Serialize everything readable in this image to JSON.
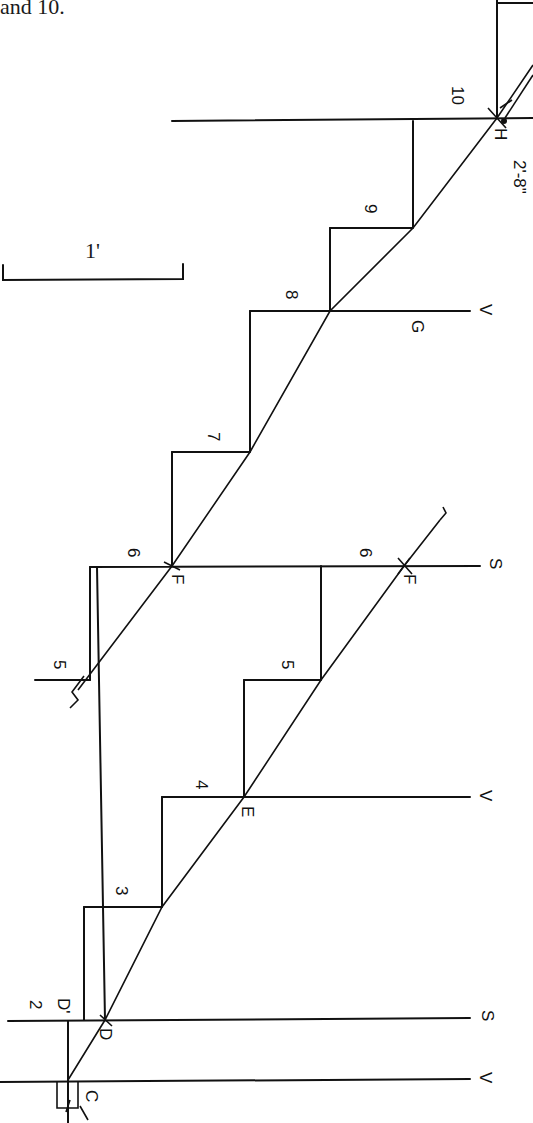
{
  "caption": "and 10.",
  "scale_bar": {
    "label": "1'"
  },
  "dimension_note": "2'-8\"",
  "points": {
    "H": "H",
    "G": "G",
    "F_left": "F",
    "F_right": "F",
    "E": "E",
    "D": "D",
    "D_prime": "D'",
    "C": "C"
  },
  "line_markers": {
    "G_line": "V",
    "E_line": "V",
    "C_line": "V",
    "F_line": "S",
    "D_line": "S"
  },
  "step_numbers": [
    "2",
    "3",
    "4",
    "5",
    "6",
    "7",
    "8",
    "9",
    "10"
  ],
  "step_numbers_right": [
    "5",
    "6"
  ],
  "step_5_left": "5"
}
